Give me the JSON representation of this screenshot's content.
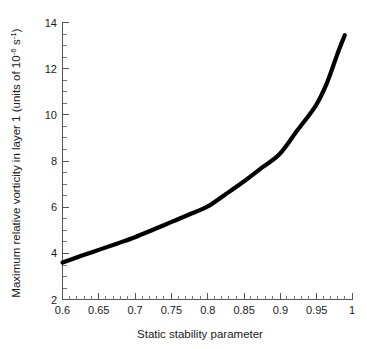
{
  "chart_data": {
    "type": "line",
    "title": "",
    "xlabel": "Static stability parameter",
    "ylabel": "Maximum relative vorticity in layer 1 (units of 10-6 s-1)",
    "ylabel_parts": {
      "prefix": "Maximum relative vorticity in layer 1 (units of 10",
      "sup1": "-6",
      "middle": " s",
      "sup2": "-1",
      "suffix": ")"
    },
    "xlim": [
      0.6,
      1.0
    ],
    "ylim": [
      2,
      14
    ],
    "grid": false,
    "legend": false,
    "x_ticks": [
      0.6,
      0.65,
      0.7,
      0.75,
      0.8,
      0.85,
      0.9,
      0.95,
      1
    ],
    "x_tick_labels": [
      "0.6",
      "0.65",
      "0.7",
      "0.75",
      "0.8",
      "0.85",
      "0.9",
      "0.95",
      "1"
    ],
    "x_minor_step": 0.01,
    "y_ticks": [
      2,
      4,
      6,
      8,
      10,
      12,
      14
    ],
    "y_tick_labels": [
      "2",
      "4",
      "6",
      "8",
      "10",
      "12",
      "14"
    ],
    "y_minor_step": 0.5,
    "series": [
      {
        "name": "Maximum relative vorticity",
        "color": "#000000",
        "x": [
          0.6,
          0.625,
          0.65,
          0.675,
          0.7,
          0.725,
          0.75,
          0.775,
          0.8,
          0.825,
          0.85,
          0.875,
          0.9,
          0.925,
          0.95,
          0.965,
          0.98,
          0.99
        ],
        "values": [
          3.6,
          3.88,
          4.15,
          4.42,
          4.7,
          5.02,
          5.35,
          5.68,
          6.02,
          6.55,
          7.1,
          7.7,
          8.3,
          9.35,
          10.4,
          11.35,
          12.65,
          13.45
        ]
      }
    ]
  },
  "axes": {
    "x_axis_name": "x-axis",
    "y_axis_name": "y-axis"
  }
}
